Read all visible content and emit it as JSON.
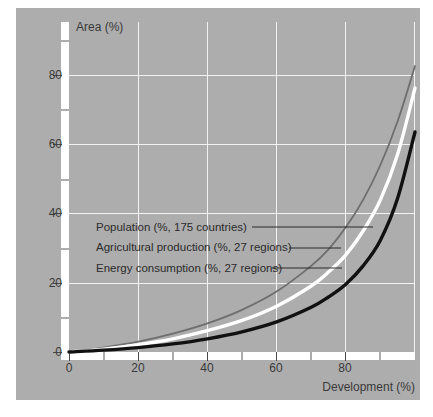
{
  "chart_data": {
    "type": "line",
    "title": "",
    "xlabel": "Development (%)",
    "ylabel": "Area (%)",
    "xlim": [
      0,
      100
    ],
    "ylim": [
      0,
      90
    ],
    "grid": true,
    "legend_position": "inside-leader-lines",
    "background_color": "#adadad",
    "grid_color": "#f2f2f2",
    "axis_color": "#4a4a4a",
    "xticks": [
      0,
      20,
      40,
      60,
      80
    ],
    "yticks": [
      0,
      20,
      40,
      60,
      80
    ],
    "yticks_minor": [
      10,
      30,
      50,
      70,
      90
    ],
    "series": [
      {
        "name": "Population (%, 175 countries)",
        "color": "#6e6e6e",
        "x": [
          0,
          10,
          20,
          30,
          40,
          50,
          60,
          70,
          75,
          80,
          85,
          90,
          95,
          100
        ],
        "values": [
          0,
          1.2,
          2.8,
          5.0,
          7.8,
          11.5,
          16.5,
          23.5,
          28.0,
          34.0,
          41.5,
          51.0,
          63.0,
          78.0
        ]
      },
      {
        "name": "Agricultural production (%, 27 regions)",
        "color": "#ffffff",
        "x": [
          0,
          10,
          20,
          30,
          40,
          50,
          60,
          70,
          75,
          80,
          85,
          90,
          95,
          100
        ],
        "values": [
          0,
          0.8,
          2.0,
          3.6,
          5.8,
          8.6,
          12.5,
          18.0,
          21.8,
          26.5,
          33.0,
          41.5,
          54.0,
          72.0
        ]
      },
      {
        "name": "Energy consumption (%, 27 regions)",
        "color": "#111111",
        "x": [
          0,
          10,
          20,
          30,
          40,
          50,
          60,
          70,
          75,
          80,
          85,
          90,
          95,
          100
        ],
        "values": [
          0,
          0.5,
          1.2,
          2.2,
          3.6,
          5.5,
          8.2,
          12.2,
          15.0,
          18.5,
          23.5,
          30.5,
          42.0,
          60.0
        ]
      }
    ],
    "legend_entries": [
      "Population (%, 175 countries)",
      "Agricultural production (%, 27 regions)",
      "Energy consumption (%, 27 regions)"
    ]
  }
}
